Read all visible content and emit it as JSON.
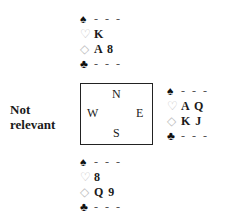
{
  "diagram": {
    "type": "bridge-hand-diagram",
    "west_note": [
      "Not",
      "relevant"
    ],
    "compass": {
      "north": "N",
      "south": "S",
      "east": "E",
      "west": "W"
    },
    "hands": {
      "north": {
        "spades": "- - -",
        "hearts": "K",
        "diamonds": "A 8",
        "clubs": "- - -"
      },
      "east": {
        "spades": "- - -",
        "hearts": "A Q",
        "diamonds": "K J",
        "clubs": "- - -"
      },
      "south": {
        "spades": "- - -",
        "hearts": "8",
        "diamonds": "Q 9",
        "clubs": "- - -"
      }
    },
    "suit_symbols": {
      "spades": "♠",
      "hearts": "♡",
      "diamonds": "◇",
      "clubs": "♣"
    }
  }
}
